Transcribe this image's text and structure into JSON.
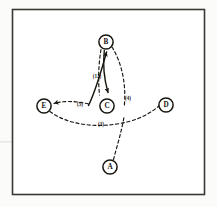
{
  "figure": {
    "kind": "hand-drawn-graph-diagram",
    "background_color": "#fbfbfa",
    "ink_color": "#17150f",
    "frame": {
      "name": "figure-border",
      "border_color": "#3a3833",
      "x": 12,
      "y": 9,
      "width": 193,
      "height": 186
    },
    "stray_mark": {
      "name": "scan-artifact-line",
      "color": "#e7e7e4",
      "x": 0,
      "y": 141,
      "width": 13,
      "height": 2
    }
  },
  "nodes": [
    {
      "id": "A",
      "label": "A",
      "cx": 110,
      "cy": 167,
      "r": 7.2
    },
    {
      "id": "B",
      "label": "B",
      "cx": 106,
      "cy": 42,
      "r": 7.2
    },
    {
      "id": "C",
      "label": "C",
      "cx": 107,
      "cy": 106,
      "r": 7.2
    },
    {
      "id": "D",
      "label": "D",
      "cx": 166,
      "cy": 105,
      "r": 7.2
    },
    {
      "id": "E",
      "label": "E",
      "cx": 44,
      "cy": 106,
      "r": 7.2
    }
  ],
  "edges": [
    {
      "name": "edge-b-c-solid-down",
      "from": "B",
      "to": "C",
      "style": "solid",
      "arrow": "to",
      "path": "M 104.5 50.5 C 103.2 64.0 104.0 78.0 108.4 92.0"
    },
    {
      "name": "edge-c-b-solid-up",
      "from": "C",
      "to": "B",
      "style": "solid",
      "arrow": "to",
      "path": "M 88.5 104.5 C 96.0 88.0 101.5 68.0 107.2 51.5"
    },
    {
      "name": "edge-b-c-dashed-left",
      "from": "B",
      "to": "C",
      "style": "dashed",
      "arrow": "none",
      "path": "M 101.0 49.5 C 98.5 64.5 98.0 80.0 99.5 95.0"
    },
    {
      "name": "edge-b-d-dashed-right",
      "from": "B",
      "to": "cross",
      "style": "dashed",
      "arrow": "none",
      "path": "M 112.0 47.0 C 122.0 63.0 126.5 85.0 124.0 105.0"
    },
    {
      "name": "edge-e-c-dashed",
      "from": "C",
      "to": "E",
      "style": "dashed",
      "arrow": "to",
      "path": "M 88.0 105.0 C 72.0 102.0 60.0 102.5 52.0 104.0"
    },
    {
      "name": "edge-e-d-dashed-baseline",
      "from": "E",
      "to": "D",
      "style": "dashed",
      "arrow": "none",
      "path": "M 50.5 110.0 C 72.0 126.0 104.0 128.0 130.0 121.0 C 145.0 117.0 153.0 111.0 159.0 106.0"
    },
    {
      "name": "edge-a-cross-dashed",
      "from": "A",
      "to": "cross",
      "style": "dashed",
      "arrow": "none",
      "path": "M 113.5 159.5 C 117.0 146.0 121.5 132.0 124.5 118.0"
    }
  ],
  "edge_labels": [
    {
      "name": "edge-label-b-c",
      "text": "(12)",
      "x": 99,
      "y": 76
    },
    {
      "name": "edge-label-b-d",
      "text": "(4)",
      "x": 126,
      "y": 98
    },
    {
      "name": "edge-label-e-c",
      "text": "(5)",
      "x": 80,
      "y": 106
    },
    {
      "name": "edge-label-e-d",
      "text": "(3)",
      "x": 101,
      "y": 124
    }
  ]
}
